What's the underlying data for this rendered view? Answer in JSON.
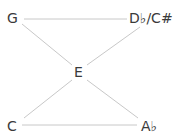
{
  "diagram": {
    "nodes": [
      {
        "id": "G",
        "label": "G"
      },
      {
        "id": "Db",
        "label": "D♭/C#"
      },
      {
        "id": "E",
        "label": "E"
      },
      {
        "id": "C",
        "label": "C"
      },
      {
        "id": "Ab",
        "label": "A♭"
      }
    ],
    "edges": [
      [
        "G",
        "Db"
      ],
      [
        "G",
        "E"
      ],
      [
        "Db",
        "E"
      ],
      [
        "E",
        "C"
      ],
      [
        "E",
        "Ab"
      ],
      [
        "C",
        "Ab"
      ]
    ],
    "line_color": "#c8c8c8",
    "text_color": "#3a3a3a"
  }
}
